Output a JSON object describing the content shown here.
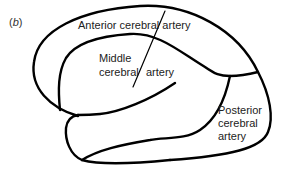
{
  "figure": {
    "panel_label": "(b)",
    "panel_letter": "b",
    "stroke_color": "#000000",
    "text_color": "#222222",
    "regions": [
      {
        "name": "anterior",
        "label": "Anterior cerebral artery"
      },
      {
        "name": "middle",
        "label_line1": "Middle",
        "label_line2": "cerebral",
        "label_line3": "artery"
      },
      {
        "name": "posterior",
        "label_line1": "Posterior",
        "label_line2": "cerebral",
        "label_line3": "artery"
      }
    ]
  }
}
